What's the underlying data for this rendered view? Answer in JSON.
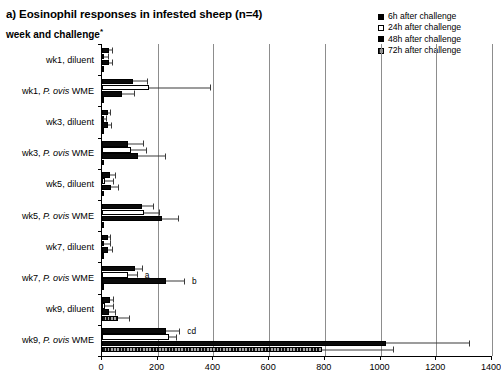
{
  "title": "a) Eosinophil responses in infested sheep (n=4)",
  "axis_title": "week and challenge",
  "axis_title_marker": "*",
  "legend": {
    "position": "top-right",
    "items": [
      {
        "label": "6h after challenge",
        "key": "6h",
        "swatch": "solid-black"
      },
      {
        "label": "24h after challenge",
        "key": "24h",
        "swatch": "open-white"
      },
      {
        "label": "48h after challenge",
        "key": "48h",
        "swatch": "solid-black"
      },
      {
        "label": "72h after challenge",
        "key": "72h",
        "swatch": "gray-hatched"
      }
    ]
  },
  "xaxis": {
    "ticks": [
      "0",
      "200",
      "400",
      "600",
      "800",
      "1000",
      "1200",
      "1400"
    ],
    "min": 0,
    "max": 1400,
    "step": 200
  },
  "chart_data": {
    "type": "bar",
    "orientation": "horizontal",
    "title": "a) Eosinophil responses in infested sheep (n=4)",
    "xlabel": "",
    "ylabel": "week and challenge*",
    "xlim": [
      0,
      1400
    ],
    "grid": true,
    "legend_position": "top-right",
    "categories": [
      "wk1, diluent",
      "wk1, P. ovis WME",
      "wk3, diluent",
      "wk3, P. ovis WME",
      "wk5, diluent",
      "wk5, P. ovis WME",
      "wk7, diluent",
      "wk7, P. ovis WME",
      "wk9, diluent",
      "wk9, P. ovis WME"
    ],
    "series": [
      {
        "name": "6h after challenge",
        "values": [
          26,
          112,
          22,
          95,
          30,
          143,
          20,
          120,
          30,
          228
        ],
        "errors": [
          14,
          52,
          12,
          55,
          22,
          45,
          12,
          28,
          12,
          53
        ]
      },
      {
        "name": "24h after challenge",
        "values": [
          8,
          170,
          5,
          103,
          12,
          150,
          8,
          93,
          9,
          240
        ],
        "errors": [
          18,
          220,
          14,
          58,
          30,
          58,
          24,
          35,
          34,
          30
        ]
      },
      {
        "name": "48h after challenge",
        "values": [
          25,
          73,
          23,
          128,
          32,
          215,
          23,
          228,
          24,
          1020
        ],
        "errors": [
          15,
          45,
          12,
          100,
          30,
          62,
          15,
          70,
          28,
          300
        ]
      },
      {
        "name": "72h after challenge",
        "values": [
          3,
          4,
          3,
          4,
          3,
          6,
          3,
          5,
          56,
          790
        ],
        "errors": [
          0,
          0,
          0,
          0,
          0,
          0,
          0,
          0,
          46,
          260
        ]
      }
    ],
    "annotations": [
      {
        "text": "a",
        "category": "wk7, P. ovis WME",
        "series": "24h after challenge"
      },
      {
        "text": "b",
        "category": "wk7, P. ovis WME",
        "series": "48h after challenge"
      },
      {
        "text": "cd",
        "category": "wk9, P. ovis WME",
        "series": "6h after challenge"
      }
    ]
  }
}
